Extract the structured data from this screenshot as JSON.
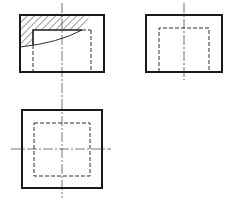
{
  "figure": {
    "stroke_color": "#1a1a1a",
    "background": "#ffffff",
    "views": [
      {
        "name": "front-view",
        "outer_rect": {
          "x": 20,
          "y": 15,
          "w": 84,
          "h": 57
        },
        "centerline_vertical": {
          "x": 62,
          "y1": 3,
          "y2": 100
        },
        "hidden_lines": [
          {
            "x1": 33,
            "y1": 45,
            "x2": 33,
            "y2": 72
          },
          {
            "x1": 80,
            "y1": 30,
            "x2": 91,
            "y2": 30
          },
          {
            "x1": 91,
            "y1": 30,
            "x2": 91,
            "y2": 72
          }
        ],
        "section": {
          "hatched": true,
          "inner_edge": [
            [
              33,
              45
            ],
            [
              33,
              30
            ],
            [
              80,
              30
            ]
          ],
          "break_curve": "M20,47 Q55,44 82,30"
        }
      },
      {
        "name": "side-view",
        "outer_rect": {
          "x": 146,
          "y": 15,
          "w": 76,
          "h": 57
        },
        "centerline_vertical": {
          "x": 184,
          "y1": 3,
          "y2": 80
        },
        "hidden_rect": {
          "x": 159,
          "y": 28,
          "w": 50,
          "h": 44,
          "open_bottom": true
        }
      },
      {
        "name": "top-view",
        "outer_rect": {
          "x": 22,
          "y": 110,
          "w": 80,
          "h": 78
        },
        "centerline_vertical": {
          "x": 62,
          "y1": 100,
          "y2": 198
        },
        "centerline_horizontal": {
          "y": 149,
          "x1": 11,
          "x2": 111
        },
        "hidden_rect": {
          "x": 34,
          "y": 123,
          "w": 56,
          "h": 53
        }
      }
    ]
  }
}
